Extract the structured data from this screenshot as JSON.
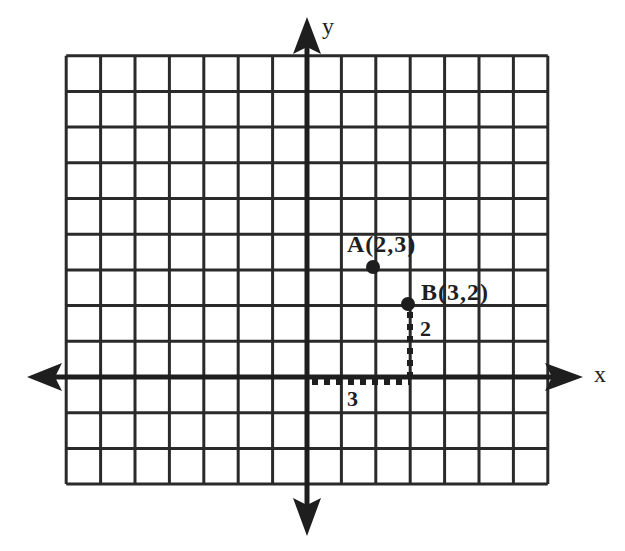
{
  "diagram": {
    "axes": {
      "x_label": "x",
      "y_label": "y"
    },
    "grid": {
      "columns_left_of_y_axis": 7,
      "columns_right_of_y_axis": 7,
      "rows_above_x_axis": 9,
      "rows_below_x_axis": 3
    },
    "points": [
      {
        "name": "A",
        "x": 2,
        "y": 3,
        "label": "A(2,3)"
      },
      {
        "name": "B",
        "x": 3,
        "y": 2,
        "label": "B(3,2)"
      }
    ],
    "path_to_B": {
      "horizontal_length_label": "3",
      "vertical_length_label": "2"
    },
    "colors": {
      "ink": "#1e1e1e",
      "background": "#ffffff"
    }
  }
}
